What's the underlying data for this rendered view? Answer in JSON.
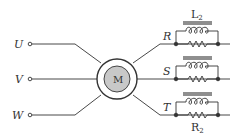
{
  "diagram": {
    "type": "electrical-schematic",
    "inputs": [
      {
        "label": "U",
        "y": 44
      },
      {
        "label": "V",
        "y": 79
      },
      {
        "label": "W",
        "y": 115
      }
    ],
    "motor": {
      "label": "M",
      "fill": "#c8c8c8"
    },
    "outputs": [
      {
        "label": "R",
        "y": 44
      },
      {
        "label": "S",
        "y": 79
      },
      {
        "label": "T",
        "y": 115
      }
    ],
    "inductor_label": {
      "main": "L",
      "sub": "2"
    },
    "resistor_label": {
      "main": "R",
      "sub": "2"
    },
    "colors": {
      "stroke": "#333333",
      "motor_fill": "#c8c8c8"
    }
  }
}
